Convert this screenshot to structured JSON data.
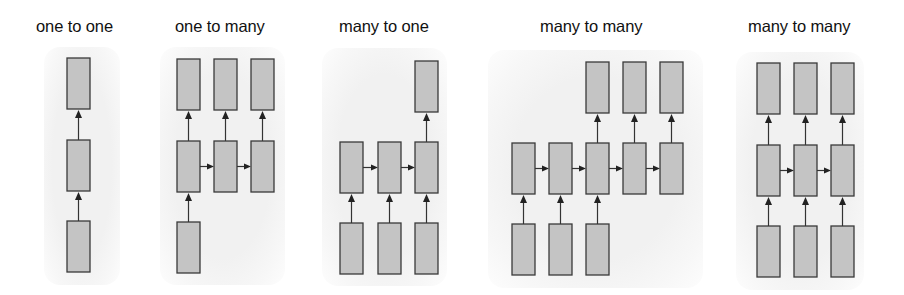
{
  "diagram": {
    "type": "rnn-sequence-types",
    "colors": {
      "box_fill": "#c4c4c4",
      "box_stroke": "#3a3a3a",
      "arrow": "#222222",
      "panel_bg": "#f1f1f1"
    },
    "box": {
      "width": 23,
      "height": 51
    },
    "panels": [
      {
        "title": "one to one",
        "title_x": 36,
        "bg": {
          "x": 44,
          "y": 47,
          "w": 76,
          "h": 238
        },
        "cols": [
          67
        ],
        "rows": {
          "output": 58,
          "hidden": 140,
          "input": 221
        },
        "outputs": [
          0
        ],
        "hiddens": [
          0
        ],
        "inputs": [
          0
        ]
      },
      {
        "title": "one to many",
        "title_x": 175,
        "bg": {
          "x": 160,
          "y": 47,
          "w": 125,
          "h": 238
        },
        "cols": [
          177,
          214,
          251
        ],
        "rows": {
          "output": 59,
          "hidden": 141,
          "input": 222
        },
        "outputs": [
          0,
          1,
          2
        ],
        "hiddens": [
          0,
          1,
          2
        ],
        "inputs": [
          0
        ]
      },
      {
        "title": "many to one",
        "title_x": 339,
        "bg": {
          "x": 322,
          "y": 48,
          "w": 125,
          "h": 238
        },
        "cols": [
          340,
          378,
          415
        ],
        "rows": {
          "output": 61,
          "hidden": 142,
          "input": 223
        },
        "outputs": [
          2
        ],
        "hiddens": [
          0,
          1,
          2
        ],
        "inputs": [
          0,
          1,
          2
        ]
      },
      {
        "title": "many to many",
        "title_x": 540,
        "bg": {
          "x": 488,
          "y": 50,
          "w": 215,
          "h": 238
        },
        "cols": [
          512,
          549,
          586,
          623,
          660
        ],
        "rows": {
          "output": 62,
          "hidden": 143,
          "input": 224
        },
        "outputs": [
          2,
          3,
          4
        ],
        "hiddens": [
          0,
          1,
          2,
          3,
          4
        ],
        "inputs": [
          0,
          1,
          2
        ]
      },
      {
        "title": "many to many",
        "title_x": 748,
        "bg": {
          "x": 736,
          "y": 52,
          "w": 128,
          "h": 238
        },
        "cols": [
          757,
          794,
          831
        ],
        "rows": {
          "output": 63,
          "hidden": 145,
          "input": 226
        },
        "outputs": [
          0,
          1,
          2
        ],
        "hiddens": [
          0,
          1,
          2
        ],
        "inputs": [
          0,
          1,
          2
        ]
      }
    ]
  }
}
